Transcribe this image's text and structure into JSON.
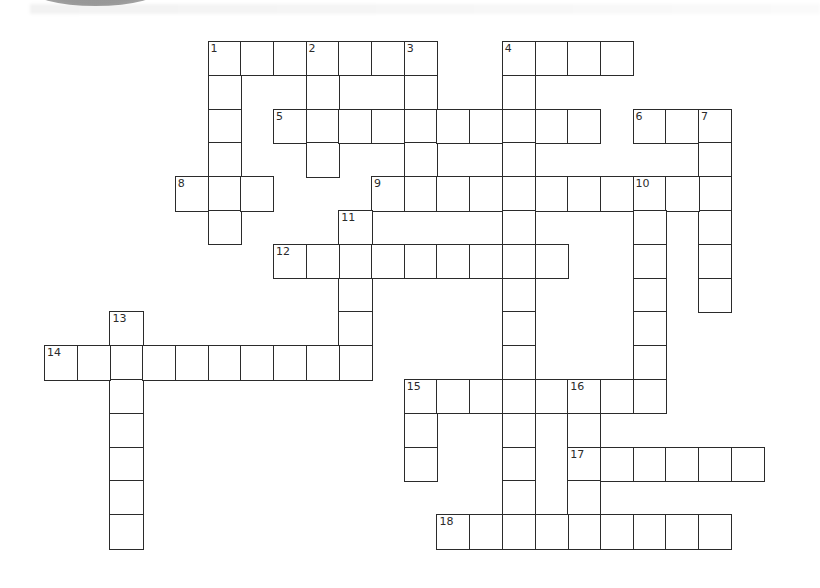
{
  "puzzle": {
    "title": "",
    "grid": {
      "origin_x": 44,
      "origin_y": 41,
      "cell_w": 32.7,
      "cell_h": 33.8,
      "border_color": "#2b2b2b",
      "cell_color": "#ffffff"
    },
    "entries": [
      {
        "number": "1",
        "direction": "across",
        "row": 0,
        "col": 5,
        "length": 7
      },
      {
        "number": "4",
        "direction": "across",
        "row": 0,
        "col": 14,
        "length": 4
      },
      {
        "number": "1",
        "direction": "down",
        "row": 0,
        "col": 5,
        "length": 6
      },
      {
        "number": "2",
        "direction": "down",
        "row": 0,
        "col": 8,
        "length": 4
      },
      {
        "number": "3",
        "direction": "down",
        "row": 0,
        "col": 11,
        "length": 5
      },
      {
        "number": "4",
        "direction": "down",
        "row": 0,
        "col": 14,
        "length": 15
      },
      {
        "number": "5",
        "direction": "across",
        "row": 2,
        "col": 7,
        "length": 10
      },
      {
        "number": "6",
        "direction": "across",
        "row": 2,
        "col": 18,
        "length": 3
      },
      {
        "number": "7",
        "direction": "down",
        "row": 2,
        "col": 20,
        "length": 6
      },
      {
        "number": "8",
        "direction": "across",
        "row": 4,
        "col": 4,
        "length": 3
      },
      {
        "number": "9",
        "direction": "across",
        "row": 4,
        "col": 10,
        "length": 11
      },
      {
        "number": "10",
        "direction": "down",
        "row": 4,
        "col": 18,
        "length": 7
      },
      {
        "number": "11",
        "direction": "down",
        "row": 5,
        "col": 9,
        "length": 5
      },
      {
        "number": "12",
        "direction": "across",
        "row": 6,
        "col": 7,
        "length": 9
      },
      {
        "number": "13",
        "direction": "down",
        "row": 8,
        "col": 2,
        "length": 7
      },
      {
        "number": "14",
        "direction": "across",
        "row": 9,
        "col": 0,
        "length": 10
      },
      {
        "number": "15",
        "direction": "across",
        "row": 10,
        "col": 11,
        "length": 8
      },
      {
        "number": "15",
        "direction": "down",
        "row": 10,
        "col": 11,
        "length": 3
      },
      {
        "number": "16",
        "direction": "down",
        "row": 10,
        "col": 16,
        "length": 5
      },
      {
        "number": "17",
        "direction": "across",
        "row": 12,
        "col": 16,
        "length": 6
      },
      {
        "number": "18",
        "direction": "across",
        "row": 14,
        "col": 12,
        "length": 9
      }
    ],
    "clue_numbers": [
      "1",
      "2",
      "3",
      "4",
      "5",
      "6",
      "7",
      "8",
      "9",
      "10",
      "11",
      "12",
      "13",
      "14",
      "15",
      "16",
      "17",
      "18"
    ]
  }
}
